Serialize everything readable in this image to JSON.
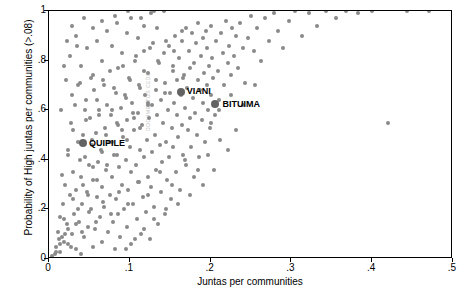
{
  "chart_data": {
    "type": "scatter",
    "title": "",
    "xlabel": "Juntas per communities",
    "ylabel": "Probability of High juntas per communities (>.08)",
    "xlim": [
      0,
      0.5
    ],
    "ylim": [
      0,
      1.0
    ],
    "xticks": [
      "0",
      ".1",
      ".2",
      ".3",
      ".4",
      ".5"
    ],
    "xtick_values": [
      0,
      0.1,
      0.2,
      0.3,
      0.4,
      0.5
    ],
    "yticks": [
      "0",
      ".2",
      ".4",
      ".6",
      ".8",
      "1"
    ],
    "ytick_values": [
      0,
      0.2,
      0.4,
      0.6,
      0.8,
      1.0
    ],
    "grid": false,
    "legend": "none",
    "marker_color": "#8a8a8a",
    "highlight_color": "#636363",
    "annotations": [
      {
        "label": "VIANI",
        "x": 0.163,
        "y": 0.675,
        "label_dx": 6,
        "label_dy": -1
      },
      {
        "label": "BITUIMA",
        "x": 0.206,
        "y": 0.625,
        "label_dx": 7,
        "label_dy": 0
      },
      {
        "label": "QUIPILE",
        "x": 0.042,
        "y": 0.468,
        "label_dx": 6,
        "label_dy": 0
      }
    ],
    "watermark": "DOCUMENTOS CEDE",
    "points": [
      [
        0.004,
        0.013
      ],
      [
        0.006,
        0.0
      ],
      [
        0.007,
        0.02
      ],
      [
        0.008,
        0.0
      ],
      [
        0.009,
        0.05
      ],
      [
        0.01,
        0.0
      ],
      [
        0.011,
        0.11
      ],
      [
        0.012,
        0.0
      ],
      [
        0.013,
        0.17
      ],
      [
        0.014,
        0.03
      ],
      [
        0.015,
        0.0
      ],
      [
        0.016,
        0.09
      ],
      [
        0.017,
        0.22
      ],
      [
        0.018,
        0.0
      ],
      [
        0.019,
        0.07
      ],
      [
        0.02,
        0.3
      ],
      [
        0.021,
        0.0
      ],
      [
        0.022,
        0.14
      ],
      [
        0.023,
        0.42
      ],
      [
        0.024,
        0.06
      ],
      [
        0.025,
        0.0
      ],
      [
        0.026,
        0.26
      ],
      [
        0.027,
        0.55
      ],
      [
        0.028,
        0.1
      ],
      [
        0.029,
        0.0
      ],
      [
        0.03,
        0.35
      ],
      [
        0.031,
        0.18
      ],
      [
        0.032,
        0.62
      ],
      [
        0.033,
        0.04
      ],
      [
        0.034,
        0.28
      ],
      [
        0.035,
        0.0
      ],
      [
        0.036,
        0.47
      ],
      [
        0.037,
        0.15
      ],
      [
        0.038,
        0.71
      ],
      [
        0.039,
        0.33
      ],
      [
        0.04,
        0.02
      ],
      [
        0.041,
        0.22
      ],
      [
        0.042,
        0.5
      ],
      [
        0.043,
        0.09
      ],
      [
        0.044,
        0.41
      ],
      [
        0.045,
        0.0
      ],
      [
        0.046,
        0.64
      ],
      [
        0.047,
        0.27
      ],
      [
        0.048,
        0.13
      ],
      [
        0.049,
        0.38
      ],
      [
        0.05,
        0.0
      ],
      [
        0.051,
        0.57
      ],
      [
        0.052,
        0.2
      ],
      [
        0.053,
        0.46
      ],
      [
        0.054,
        0.05
      ],
      [
        0.055,
        0.32
      ],
      [
        0.056,
        0.68
      ],
      [
        0.057,
        0.12
      ],
      [
        0.058,
        0.51
      ],
      [
        0.059,
        0.25
      ],
      [
        0.06,
        0.0
      ],
      [
        0.061,
        0.39
      ],
      [
        0.062,
        0.6
      ],
      [
        0.063,
        0.17
      ],
      [
        0.064,
        0.44
      ],
      [
        0.065,
        0.07
      ],
      [
        0.066,
        0.29
      ],
      [
        0.067,
        0.72
      ],
      [
        0.068,
        0.21
      ],
      [
        0.069,
        0.53
      ],
      [
        0.07,
        0.0
      ],
      [
        0.071,
        0.36
      ],
      [
        0.072,
        0.62
      ],
      [
        0.073,
        0.11
      ],
      [
        0.074,
        0.47
      ],
      [
        0.075,
        0.26
      ],
      [
        0.076,
        0.0
      ],
      [
        0.077,
        0.58
      ],
      [
        0.078,
        0.33
      ],
      [
        0.079,
        0.15
      ],
      [
        0.08,
        0.69
      ],
      [
        0.081,
        0.42
      ],
      [
        0.082,
        0.04
      ],
      [
        0.083,
        0.24
      ],
      [
        0.084,
        0.55
      ],
      [
        0.085,
        0.18
      ],
      [
        0.086,
        0.77
      ],
      [
        0.087,
        0.37
      ],
      [
        0.088,
        0.09
      ],
      [
        0.089,
        0.61
      ],
      [
        0.09,
        0.3
      ],
      [
        0.091,
        0.0
      ],
      [
        0.092,
        0.49
      ],
      [
        0.093,
        0.2
      ],
      [
        0.094,
        0.66
      ],
      [
        0.095,
        0.4
      ],
      [
        0.096,
        0.13
      ],
      [
        0.097,
        0.56
      ],
      [
        0.098,
        0.28
      ],
      [
        0.099,
        0.73
      ],
      [
        0.1,
        0.45
      ],
      [
        0.101,
        0.06
      ],
      [
        0.102,
        0.35
      ],
      [
        0.103,
        0.63
      ],
      [
        0.104,
        0.22
      ],
      [
        0.105,
        0.52
      ],
      [
        0.106,
        0.0
      ],
      [
        0.107,
        0.8
      ],
      [
        0.108,
        0.38
      ],
      [
        0.109,
        0.16
      ],
      [
        0.11,
        0.59
      ],
      [
        0.111,
        0.31
      ],
      [
        0.112,
        0.7
      ],
      [
        0.113,
        0.44
      ],
      [
        0.114,
        0.1
      ],
      [
        0.115,
        0.54
      ],
      [
        0.116,
        0.25
      ],
      [
        0.117,
        0.84
      ],
      [
        0.118,
        0.41
      ],
      [
        0.119,
        0.66
      ],
      [
        0.12,
        0.19
      ],
      [
        0.121,
        0.48
      ],
      [
        0.122,
        0.33
      ],
      [
        0.123,
        0.75
      ],
      [
        0.124,
        0.57
      ],
      [
        0.125,
        0.08
      ],
      [
        0.126,
        0.29
      ],
      [
        0.127,
        0.62
      ],
      [
        0.128,
        0.43
      ],
      [
        0.129,
        0.87
      ],
      [
        0.13,
        0.21
      ],
      [
        0.131,
        0.5
      ],
      [
        0.132,
        0.68
      ],
      [
        0.133,
        0.36
      ],
      [
        0.134,
        0.58
      ],
      [
        0.135,
        0.14
      ],
      [
        0.136,
        0.79
      ],
      [
        0.137,
        0.46
      ],
      [
        0.138,
        0.27
      ],
      [
        0.139,
        0.64
      ],
      [
        0.14,
        0.39
      ],
      [
        0.141,
        0.55
      ],
      [
        0.142,
        0.83
      ],
      [
        0.143,
        0.18
      ],
      [
        0.144,
        0.71
      ],
      [
        0.145,
        0.47
      ],
      [
        0.146,
        0.32
      ],
      [
        0.147,
        0.6
      ],
      [
        0.148,
        0.86
      ],
      [
        0.149,
        0.41
      ],
      [
        0.15,
        0.67
      ],
      [
        0.151,
        0.24
      ],
      [
        0.152,
        0.53
      ],
      [
        0.153,
        0.76
      ],
      [
        0.154,
        0.45
      ],
      [
        0.155,
        0.63
      ],
      [
        0.156,
        0.9
      ],
      [
        0.157,
        0.35
      ],
      [
        0.158,
        0.58
      ],
      [
        0.159,
        0.72
      ],
      [
        0.16,
        0.49
      ],
      [
        0.161,
        0.81
      ],
      [
        0.162,
        0.28
      ],
      [
        0.163,
        0.66
      ],
      [
        0.164,
        0.88
      ],
      [
        0.165,
        0.54
      ],
      [
        0.166,
        0.42
      ],
      [
        0.167,
        0.74
      ],
      [
        0.168,
        0.61
      ],
      [
        0.169,
        0.93
      ],
      [
        0.17,
        0.38
      ],
      [
        0.171,
        0.69
      ],
      [
        0.172,
        0.52
      ],
      [
        0.173,
        0.84
      ],
      [
        0.174,
        0.57
      ],
      [
        0.175,
        0.77
      ],
      [
        0.176,
        0.45
      ],
      [
        0.177,
        0.91
      ],
      [
        0.178,
        0.65
      ],
      [
        0.179,
        0.33
      ],
      [
        0.18,
        0.79
      ],
      [
        0.181,
        0.59
      ],
      [
        0.182,
        0.87
      ],
      [
        0.183,
        0.5
      ],
      [
        0.184,
        0.72
      ],
      [
        0.185,
        0.95
      ],
      [
        0.186,
        0.41
      ],
      [
        0.187,
        0.68
      ],
      [
        0.188,
        0.82
      ],
      [
        0.189,
        0.56
      ],
      [
        0.19,
        0.89
      ],
      [
        0.191,
        0.63
      ],
      [
        0.192,
        0.75
      ],
      [
        0.193,
        0.47
      ],
      [
        0.194,
        0.92
      ],
      [
        0.195,
        0.7
      ],
      [
        0.196,
        0.85
      ],
      [
        0.197,
        0.6
      ],
      [
        0.198,
        0.78
      ],
      [
        0.199,
        0.53
      ],
      [
        0.2,
        0.94
      ],
      [
        0.201,
        0.66
      ],
      [
        0.202,
        0.81
      ],
      [
        0.203,
        0.73
      ],
      [
        0.205,
        0.58
      ],
      [
        0.207,
        0.88
      ],
      [
        0.209,
        0.76
      ],
      [
        0.211,
        0.64
      ],
      [
        0.213,
        0.91
      ],
      [
        0.215,
        0.83
      ],
      [
        0.217,
        0.7
      ],
      [
        0.219,
        0.96
      ],
      [
        0.221,
        0.79
      ],
      [
        0.223,
        0.86
      ],
      [
        0.225,
        0.74
      ],
      [
        0.227,
        0.93
      ],
      [
        0.229,
        0.82
      ],
      [
        0.231,
        0.9
      ],
      [
        0.234,
        0.77
      ],
      [
        0.237,
        0.95
      ],
      [
        0.24,
        0.85
      ],
      [
        0.243,
        0.71
      ],
      [
        0.246,
        0.89
      ],
      [
        0.25,
        0.98
      ],
      [
        0.254,
        0.84
      ],
      [
        0.258,
        0.93
      ],
      [
        0.262,
        0.8
      ],
      [
        0.267,
        0.97
      ],
      [
        0.272,
        0.88
      ],
      [
        0.278,
        0.99
      ],
      [
        0.284,
        0.92
      ],
      [
        0.29,
        0.85
      ],
      [
        0.297,
        0.96
      ],
      [
        0.305,
        1.0
      ],
      [
        0.313,
        0.9
      ],
      [
        0.322,
        0.99
      ],
      [
        0.332,
        0.94
      ],
      [
        0.343,
        1.0
      ],
      [
        0.355,
        0.97
      ],
      [
        0.368,
        1.0
      ],
      [
        0.383,
        0.99
      ],
      [
        0.4,
        1.0
      ],
      [
        0.42,
        0.55
      ],
      [
        0.443,
        1.0
      ],
      [
        0.47,
        1.0
      ],
      [
        0.031,
        0.0
      ],
      [
        0.037,
        0.0
      ],
      [
        0.043,
        0.0
      ],
      [
        0.049,
        0.0
      ],
      [
        0.055,
        0.0
      ],
      [
        0.061,
        0.0
      ],
      [
        0.067,
        0.0
      ],
      [
        0.073,
        0.0
      ],
      [
        0.079,
        0.0
      ],
      [
        0.085,
        0.0
      ],
      [
        0.091,
        0.0
      ],
      [
        0.097,
        0.0
      ],
      [
        0.103,
        0.0
      ],
      [
        0.109,
        0.0
      ],
      [
        0.115,
        0.0
      ],
      [
        0.121,
        0.0
      ],
      [
        0.127,
        0.0
      ],
      [
        0.133,
        0.0
      ],
      [
        0.14,
        0.0
      ],
      [
        0.147,
        0.0
      ],
      [
        0.155,
        0.0
      ],
      [
        0.163,
        0.0
      ],
      [
        0.172,
        0.0
      ],
      [
        0.182,
        0.0
      ],
      [
        0.026,
        0.82
      ],
      [
        0.033,
        0.9
      ],
      [
        0.04,
        0.78
      ],
      [
        0.047,
        0.85
      ],
      [
        0.054,
        0.74
      ],
      [
        0.06,
        0.88
      ],
      [
        0.066,
        0.8
      ],
      [
        0.072,
        0.92
      ],
      [
        0.078,
        0.86
      ],
      [
        0.084,
        0.95
      ],
      [
        0.09,
        0.83
      ],
      [
        0.096,
        0.91
      ],
      [
        0.102,
        0.97
      ],
      [
        0.11,
        0.89
      ],
      [
        0.118,
        0.94
      ],
      [
        0.126,
        0.99
      ],
      [
        0.134,
        0.93
      ],
      [
        0.142,
        1.0
      ],
      [
        0.021,
        0.72
      ],
      [
        0.028,
        0.66
      ],
      [
        0.036,
        0.7
      ],
      [
        0.044,
        0.6
      ],
      [
        0.052,
        0.73
      ],
      [
        0.059,
        0.64
      ],
      [
        0.068,
        0.7
      ],
      [
        0.076,
        0.76
      ],
      [
        0.083,
        0.67
      ],
      [
        0.092,
        0.78
      ],
      [
        0.1,
        0.72
      ],
      [
        0.108,
        0.82
      ],
      [
        0.117,
        0.76
      ],
      [
        0.125,
        0.85
      ],
      [
        0.135,
        0.8
      ],
      [
        0.145,
        0.88
      ],
      [
        0.155,
        0.84
      ],
      [
        0.165,
        0.92
      ],
      [
        0.016,
        0.34
      ],
      [
        0.023,
        0.44
      ],
      [
        0.03,
        0.52
      ],
      [
        0.038,
        0.4
      ],
      [
        0.046,
        0.56
      ],
      [
        0.053,
        0.48
      ],
      [
        0.062,
        0.58
      ],
      [
        0.07,
        0.5
      ],
      [
        0.078,
        0.6
      ],
      [
        0.086,
        0.54
      ],
      [
        0.095,
        0.65
      ],
      [
        0.104,
        0.59
      ],
      [
        0.113,
        0.69
      ],
      [
        0.122,
        0.63
      ],
      [
        0.132,
        0.72
      ],
      [
        0.143,
        0.67
      ],
      [
        0.154,
        0.78
      ],
      [
        0.166,
        0.73
      ],
      [
        0.012,
        0.08
      ],
      [
        0.018,
        0.16
      ],
      [
        0.024,
        0.12
      ],
      [
        0.03,
        0.24
      ],
      [
        0.036,
        0.2
      ],
      [
        0.042,
        0.3
      ],
      [
        0.048,
        0.26
      ],
      [
        0.054,
        0.37
      ],
      [
        0.06,
        0.32
      ],
      [
        0.066,
        0.43
      ],
      [
        0.072,
        0.38
      ],
      [
        0.078,
        0.47
      ],
      [
        0.084,
        0.42
      ],
      [
        0.09,
        0.52
      ],
      [
        0.097,
        0.48
      ],
      [
        0.105,
        0.57
      ],
      [
        0.113,
        0.53
      ],
      [
        0.122,
        0.62
      ],
      [
        0.009,
        0.03
      ],
      [
        0.014,
        0.06
      ],
      [
        0.02,
        0.1
      ],
      [
        0.027,
        0.05
      ],
      [
        0.034,
        0.14
      ],
      [
        0.041,
        0.11
      ],
      [
        0.05,
        0.19
      ],
      [
        0.058,
        0.15
      ],
      [
        0.067,
        0.23
      ],
      [
        0.077,
        0.18
      ],
      [
        0.087,
        0.27
      ],
      [
        0.098,
        0.22
      ],
      [
        0.11,
        0.31
      ],
      [
        0.123,
        0.26
      ],
      [
        0.137,
        0.35
      ],
      [
        0.152,
        0.3
      ],
      [
        0.168,
        0.4
      ],
      [
        0.185,
        0.36
      ],
      [
        0.19,
        0.3
      ],
      [
        0.197,
        0.42
      ],
      [
        0.204,
        0.36
      ],
      [
        0.212,
        0.48
      ],
      [
        0.221,
        0.44
      ],
      [
        0.231,
        0.52
      ],
      [
        0.16,
        0.22
      ],
      [
        0.175,
        0.26
      ],
      [
        0.145,
        0.2
      ],
      [
        0.13,
        0.16
      ],
      [
        0.118,
        0.12
      ],
      [
        0.106,
        0.08
      ],
      [
        0.095,
        0.04
      ],
      [
        0.2,
        0.55
      ],
      [
        0.21,
        0.6
      ],
      [
        0.225,
        0.66
      ],
      [
        0.24,
        0.62
      ],
      [
        0.255,
        0.7
      ],
      [
        0.066,
        0.96
      ],
      [
        0.082,
        0.98
      ],
      [
        0.098,
        1.0
      ],
      [
        0.055,
        0.93
      ],
      [
        0.114,
        0.97
      ],
      [
        0.13,
        1.0
      ],
      [
        0.043,
        0.97
      ],
      [
        0.035,
        0.86
      ],
      [
        0.029,
        0.94
      ],
      [
        0.022,
        0.88
      ],
      [
        0.018,
        0.78
      ],
      [
        0.015,
        0.6
      ]
    ]
  }
}
